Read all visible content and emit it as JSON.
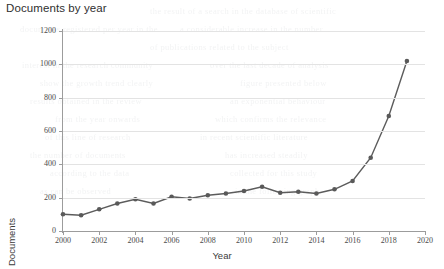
{
  "chart_data": {
    "type": "line",
    "title": "Documents by year",
    "xlabel": "Year",
    "ylabel": "Documents",
    "x": [
      2000,
      2001,
      2002,
      2003,
      2004,
      2005,
      2006,
      2007,
      2008,
      2009,
      2010,
      2011,
      2012,
      2013,
      2014,
      2015,
      2016,
      2017,
      2018,
      2019
    ],
    "values": [
      100,
      95,
      130,
      165,
      190,
      165,
      205,
      195,
      215,
      225,
      240,
      265,
      230,
      235,
      225,
      250,
      300,
      440,
      690,
      1020
    ],
    "series": [
      {
        "name": "Documents",
        "values": [
          100,
          95,
          130,
          165,
          190,
          165,
          205,
          195,
          215,
          225,
          240,
          265,
          230,
          235,
          225,
          250,
          300,
          440,
          690,
          1020
        ]
      }
    ],
    "xlim": [
      2000,
      2020
    ],
    "ylim": [
      0,
      1200
    ],
    "ytick_labels": [
      "0",
      "200",
      "400",
      "600",
      "800",
      "1000",
      "1200"
    ],
    "ytick_values": [
      0,
      200,
      400,
      600,
      800,
      1000,
      1200
    ],
    "xtick_labels": [
      "2000",
      "2002",
      "2004",
      "2006",
      "2008",
      "2010",
      "2012",
      "2014",
      "2016",
      "2018",
      "2020"
    ],
    "xtick_values": [
      2000,
      2002,
      2004,
      2006,
      2008,
      2010,
      2012,
      2014,
      2016,
      2018,
      2020
    ],
    "grid": "horizontal",
    "legend": "none",
    "line_color": "#5c5c5c",
    "marker_color": "#595959",
    "grid_color": "#e3e3e3",
    "axis_color": "#9c9c9c",
    "background_color": "#ffffff"
  },
  "background_artifacts": [
    {
      "text": "the result of a search in the database of scientific",
      "x": 150,
      "y": 6
    },
    {
      "text": "documents registered per year in the",
      "x": 20,
      "y": 24
    },
    {
      "text": "a considerable increase in the number",
      "x": 180,
      "y": 24
    },
    {
      "text": "of publications related to the subject",
      "x": 150,
      "y": 42
    },
    {
      "text": "interest in the research community",
      "x": 22,
      "y": 60
    },
    {
      "text": "over the last decade of analysis",
      "x": 210,
      "y": 60
    },
    {
      "text": "show the growth trend clearly",
      "x": 40,
      "y": 78
    },
    {
      "text": "figure presented below",
      "x": 240,
      "y": 78
    },
    {
      "text": "results obtained in the review",
      "x": 30,
      "y": 96
    },
    {
      "text": "an exponential behaviour",
      "x": 230,
      "y": 96
    },
    {
      "text": "from the year onwards",
      "x": 55,
      "y": 114
    },
    {
      "text": "which confirms the relevance",
      "x": 215,
      "y": 114
    },
    {
      "text": "of this line of research",
      "x": 45,
      "y": 132
    },
    {
      "text": "in recent scientific literature",
      "x": 200,
      "y": 132
    },
    {
      "text": "the number of documents",
      "x": 30,
      "y": 150
    },
    {
      "text": "has increased steadily",
      "x": 225,
      "y": 150
    },
    {
      "text": "according to the data",
      "x": 50,
      "y": 168
    },
    {
      "text": "collected for this study",
      "x": 230,
      "y": 168
    },
    {
      "text": "as can be observed",
      "x": 40,
      "y": 186
    },
    {
      "text": "in the following graph",
      "x": 235,
      "y": 186
    }
  ]
}
